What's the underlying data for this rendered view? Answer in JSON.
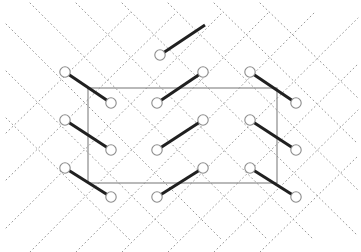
{
  "figure": {
    "type": "lattice-diagram",
    "title": "",
    "width": 361,
    "height": 252,
    "background_color": "#ffffff"
  },
  "colors": {
    "background": "#ffffff",
    "lattice_dotted_line": "#9a9a9a",
    "bond_solid": "#202020",
    "unit_cell_border": "#808080",
    "atom_fill": "#ffffff",
    "atom_stroke": "#8c8c8c"
  },
  "geometry": {
    "column_x": [
      19,
      65,
      111,
      157,
      203,
      250,
      296,
      342
    ],
    "row_y": [
      25,
      55,
      72,
      103,
      120,
      150,
      168,
      197,
      225
    ],
    "atom_radius": 5.2,
    "atom_stroke_width": 1.1,
    "bond_stroke_width": 3.0,
    "dotted_stroke_width": 1.0,
    "dotted_dash_pattern": "1,3.2",
    "unit_cell_stroke_width": 1.1,
    "bond_dx": 46,
    "bond_dy": -30
  },
  "unit_cell": {
    "label": "unit-cell",
    "x": 88,
    "y": 88,
    "width": 189,
    "height": 95,
    "x2": 277,
    "y2": 183
  },
  "dotted_lattice": {
    "label": "dotted-lattice-network",
    "direction_up_right": [
      {
        "x1": 6,
        "y1": 133,
        "x2": 130,
        "y2": 13
      },
      {
        "x1": 6,
        "y1": 180,
        "x2": 176,
        "y2": 13
      },
      {
        "x1": 6,
        "y1": 228,
        "x2": 222,
        "y2": 13
      },
      {
        "x1": 30,
        "y1": 252,
        "x2": 268,
        "y2": 13
      },
      {
        "x1": 76,
        "y1": 252,
        "x2": 314,
        "y2": 13
      },
      {
        "x1": 122,
        "y1": 252,
        "x2": 358,
        "y2": 18
      },
      {
        "x1": 168,
        "y1": 252,
        "x2": 358,
        "y2": 64
      },
      {
        "x1": 214,
        "y1": 252,
        "x2": 358,
        "y2": 110
      },
      {
        "x1": 260,
        "y1": 252,
        "x2": 358,
        "y2": 156
      }
    ],
    "direction_down_right": [
      {
        "x1": 6,
        "y1": 118,
        "x2": 130,
        "y2": 240
      },
      {
        "x1": 6,
        "y1": 71,
        "x2": 176,
        "y2": 240
      },
      {
        "x1": 6,
        "y1": 24,
        "x2": 222,
        "y2": 240
      },
      {
        "x1": 30,
        "y1": 3,
        "x2": 268,
        "y2": 240
      },
      {
        "x1": 76,
        "y1": 3,
        "x2": 314,
        "y2": 240
      },
      {
        "x1": 122,
        "y1": 3,
        "x2": 358,
        "y2": 236
      },
      {
        "x1": 168,
        "y1": 3,
        "x2": 358,
        "y2": 190
      },
      {
        "x1": 214,
        "y1": 3,
        "x2": 358,
        "y2": 144
      },
      {
        "x1": 260,
        "y1": 3,
        "x2": 358,
        "y2": 98
      }
    ]
  },
  "bonds": [
    {
      "id": "bond-top-dangling",
      "x1": 160,
      "y1": 55,
      "x2": 205,
      "y2": 25,
      "has_end_atom": false
    },
    {
      "id": "bond-r1-left",
      "x1": 65,
      "y1": 72,
      "x2": 111,
      "y2": 103,
      "has_end_atom": true
    },
    {
      "id": "bond-r1-mid",
      "x1": 157,
      "y1": 103,
      "x2": 203,
      "y2": 72,
      "has_end_atom": true
    },
    {
      "id": "bond-r1-right",
      "x1": 250,
      "y1": 72,
      "x2": 296,
      "y2": 103,
      "has_end_atom": true
    },
    {
      "id": "bond-r2-left",
      "x1": 65,
      "y1": 120,
      "x2": 111,
      "y2": 150,
      "has_end_atom": true
    },
    {
      "id": "bond-r2-mid",
      "x1": 157,
      "y1": 150,
      "x2": 203,
      "y2": 120,
      "has_end_atom": true
    },
    {
      "id": "bond-r2-right",
      "x1": 250,
      "y1": 120,
      "x2": 296,
      "y2": 150,
      "has_end_atom": true
    },
    {
      "id": "bond-r3-left",
      "x1": 65,
      "y1": 168,
      "x2": 111,
      "y2": 197,
      "has_end_atom": true
    },
    {
      "id": "bond-r3-mid",
      "x1": 157,
      "y1": 197,
      "x2": 203,
      "y2": 168,
      "has_end_atom": true
    },
    {
      "id": "bond-r3-right",
      "x1": 250,
      "y1": 168,
      "x2": 296,
      "y2": 197,
      "has_end_atom": true
    }
  ],
  "atoms": [
    {
      "id": "atom-0",
      "x": 160,
      "y": 55
    },
    {
      "id": "atom-1",
      "x": 65,
      "y": 72
    },
    {
      "id": "atom-2",
      "x": 203,
      "y": 72
    },
    {
      "id": "atom-3",
      "x": 250,
      "y": 72
    },
    {
      "id": "atom-4",
      "x": 111,
      "y": 103
    },
    {
      "id": "atom-5",
      "x": 157,
      "y": 103
    },
    {
      "id": "atom-6",
      "x": 296,
      "y": 103
    },
    {
      "id": "atom-7",
      "x": 65,
      "y": 120
    },
    {
      "id": "atom-8",
      "x": 203,
      "y": 120
    },
    {
      "id": "atom-9",
      "x": 250,
      "y": 120
    },
    {
      "id": "atom-10",
      "x": 111,
      "y": 150
    },
    {
      "id": "atom-11",
      "x": 157,
      "y": 150
    },
    {
      "id": "atom-12",
      "x": 296,
      "y": 150
    },
    {
      "id": "atom-13",
      "x": 65,
      "y": 168
    },
    {
      "id": "atom-14",
      "x": 203,
      "y": 168
    },
    {
      "id": "atom-15",
      "x": 250,
      "y": 168
    },
    {
      "id": "atom-16",
      "x": 111,
      "y": 197
    },
    {
      "id": "atom-17",
      "x": 157,
      "y": 197
    },
    {
      "id": "atom-18",
      "x": 296,
      "y": 197
    }
  ]
}
